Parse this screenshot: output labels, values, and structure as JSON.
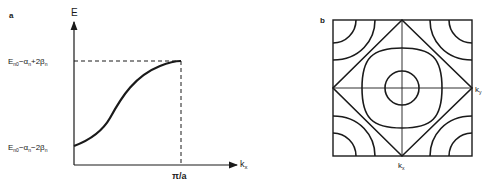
{
  "panel_a": {
    "label": "a",
    "y_axis_label": "E",
    "x_axis_label": "k",
    "x_axis_sub": "x",
    "upper_level": {
      "E": "E",
      "sub1": "n0",
      "minus": "−α",
      "sub2": "n",
      "plus": "+2β",
      "sub3": "n"
    },
    "lower_level": {
      "E": "E",
      "sub1": "n0",
      "minus": "−α",
      "sub2": "n",
      "minus2": "−2β",
      "sub3": "n"
    },
    "x_tick": "π/a"
  },
  "panel_b": {
    "label": "b",
    "ky_label": "k",
    "ky_sub": "y",
    "kx_label": "k",
    "kx_sub": "x"
  },
  "colors": {
    "ink": "#1a1a1a",
    "background": "#ffffff"
  }
}
